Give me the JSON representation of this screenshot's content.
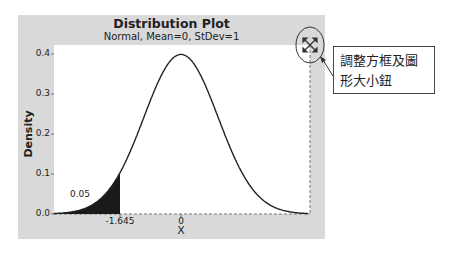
{
  "chart_data": {
    "type": "area",
    "title": "Distribution Plot",
    "subtitle": "Normal, Mean=0, StDev=1",
    "xlabel": "X",
    "ylabel": "Density",
    "xlim": [
      -3.5,
      3.5
    ],
    "ylim": [
      0.0,
      0.42
    ],
    "yticks": [
      "0.0",
      "0.1",
      "0.2",
      "0.3",
      "0.4"
    ],
    "xticks": [
      "-1.645",
      "0"
    ],
    "distribution": {
      "name": "Normal",
      "mean": 0,
      "stdev": 1
    },
    "shaded_region": {
      "from": "-inf",
      "to": -1.645,
      "probability": 0.05,
      "label": "0.05",
      "color": "#1a1a1a"
    },
    "peak_density": 0.3989,
    "grid": false,
    "legend": null
  },
  "annotation": {
    "callout_text_line1": "調整方框及圖",
    "callout_text_line2": "形大小鈕",
    "target": "resize-handle"
  },
  "colors": {
    "panel_bg": "#d9d9d9",
    "plot_bg": "#ffffff",
    "curve": "#222222",
    "shade": "#1a1a1a"
  }
}
